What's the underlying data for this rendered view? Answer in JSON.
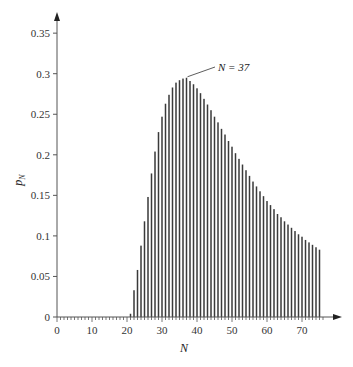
{
  "chart_data": {
    "type": "bar",
    "title": "",
    "xlabel": "N",
    "ylabel": "p_N",
    "xlim": [
      0,
      76
    ],
    "ylim": [
      0,
      0.36
    ],
    "grid": false,
    "legend": null,
    "x_ticks": [
      0,
      10,
      20,
      30,
      40,
      50,
      60,
      70
    ],
    "x_minor_tick_step": 1,
    "y_ticks": [
      0,
      0.05,
      0.1,
      0.15,
      0.2,
      0.25,
      0.3,
      0.35
    ],
    "y_tick_labels": [
      "0",
      "0.05",
      "0.1",
      "0.15",
      "0.2",
      "0.25",
      "0.3",
      "0.35"
    ],
    "annotation": {
      "text": "N = 37",
      "x": 37,
      "y": 0.295
    },
    "x": [
      21,
      22,
      23,
      24,
      25,
      26,
      27,
      28,
      29,
      30,
      31,
      32,
      33,
      34,
      35,
      36,
      37,
      38,
      39,
      40,
      41,
      42,
      43,
      44,
      45,
      46,
      47,
      48,
      49,
      50,
      51,
      52,
      53,
      54,
      55,
      56,
      57,
      58,
      59,
      60,
      61,
      62,
      63,
      64,
      65,
      66,
      67,
      68,
      69,
      70,
      71,
      72,
      73,
      74,
      75
    ],
    "values": [
      0.004,
      0.033,
      0.058,
      0.088,
      0.118,
      0.148,
      0.177,
      0.204,
      0.228,
      0.247,
      0.263,
      0.274,
      0.283,
      0.289,
      0.292,
      0.294,
      0.295,
      0.291,
      0.287,
      0.282,
      0.276,
      0.269,
      0.262,
      0.255,
      0.247,
      0.24,
      0.232,
      0.225,
      0.217,
      0.21,
      0.202,
      0.195,
      0.188,
      0.181,
      0.174,
      0.167,
      0.161,
      0.155,
      0.149,
      0.143,
      0.138,
      0.133,
      0.127,
      0.123,
      0.118,
      0.114,
      0.11,
      0.106,
      0.102,
      0.099,
      0.095,
      0.092,
      0.089,
      0.086,
      0.083
    ]
  },
  "labels": {
    "xlabel": "N",
    "ylabel_main": "p",
    "ylabel_sub": "N",
    "annotation": "N = 37"
  }
}
